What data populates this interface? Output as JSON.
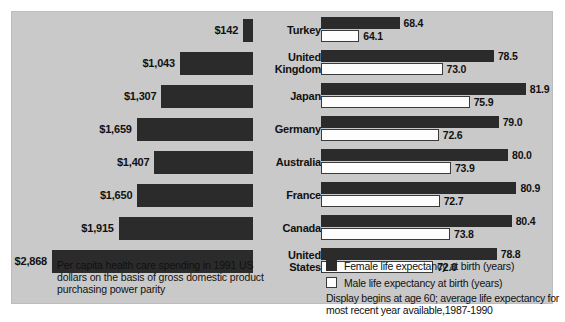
{
  "chart_data": {
    "type": "bar",
    "title": "",
    "orientation": "horizontal",
    "categories": [
      "Turkey",
      "United Kingdom",
      "Japan",
      "Germany",
      "Australia",
      "France",
      "Canada",
      "United States"
    ],
    "panels": [
      {
        "name": "per-capita-health-care-spending",
        "direction": "right-to-left",
        "ylabel": "",
        "xlabel": "Per capita health care spending (1991 US dollars, PPP)",
        "value_prefix": "$",
        "values": [
          142,
          1043,
          1307,
          1659,
          1407,
          1650,
          1915,
          2868
        ],
        "value_labels": [
          "$142",
          "$1,043",
          "$1,307",
          "$1,659",
          "$1,407",
          "$1,650",
          "$1,915",
          "$2,868"
        ],
        "xlim": [
          0,
          2868
        ],
        "color": "#2b2b2b"
      },
      {
        "name": "life-expectancy-at-birth",
        "direction": "left-to-right",
        "xlabel": "Life expectancy at birth (years)",
        "xlim": [
          60,
          83
        ],
        "axis_start": 60,
        "series": [
          {
            "name": "Female life expectancy at birth (years)",
            "color": "#2b2b2b",
            "values": [
              68.4,
              78.5,
              81.9,
              79.0,
              80.0,
              80.9,
              80.4,
              78.8
            ],
            "value_labels": [
              "68.4",
              "78.5",
              "81.9",
              "79.0",
              "80.0",
              "80.9",
              "80.4",
              "78.8"
            ]
          },
          {
            "name": "Male life expectancy at birth (years)",
            "color": "#ffffff",
            "values": [
              64.1,
              73.0,
              75.9,
              72.6,
              73.9,
              72.7,
              73.8,
              72.0
            ],
            "value_labels": [
              "64.1",
              "73.0",
              "75.9",
              "72.6",
              "73.9",
              "72.7",
              "73.8",
              "72.0"
            ]
          }
        ],
        "grid": false,
        "legend_position": "bottom-right"
      }
    ]
  },
  "rows": [
    {
      "country_line1": "Turkey",
      "country_line2": "",
      "spend_label": "$142",
      "spend": 142,
      "female": 68.4,
      "female_label": "68.4",
      "male": 64.1,
      "male_label": "64.1"
    },
    {
      "country_line1": "United",
      "country_line2": "Kingdom",
      "spend_label": "$1,043",
      "spend": 1043,
      "female": 78.5,
      "female_label": "78.5",
      "male": 73.0,
      "male_label": "73.0"
    },
    {
      "country_line1": "Japan",
      "country_line2": "",
      "spend_label": "$1,307",
      "spend": 1307,
      "female": 81.9,
      "female_label": "81.9",
      "male": 75.9,
      "male_label": "75.9"
    },
    {
      "country_line1": "Germany",
      "country_line2": "",
      "spend_label": "$1,659",
      "spend": 1659,
      "female": 79.0,
      "female_label": "79.0",
      "male": 72.6,
      "male_label": "72.6"
    },
    {
      "country_line1": "Australia",
      "country_line2": "",
      "spend_label": "$1,407",
      "spend": 1407,
      "female": 80.0,
      "female_label": "80.0",
      "male": 73.9,
      "male_label": "73.9"
    },
    {
      "country_line1": "France",
      "country_line2": "",
      "spend_label": "$1,650",
      "spend": 1650,
      "female": 80.9,
      "female_label": "80.9",
      "male": 72.7,
      "male_label": "72.7"
    },
    {
      "country_line1": "Canada",
      "country_line2": "",
      "spend_label": "$1,915",
      "spend": 1915,
      "female": 80.4,
      "female_label": "80.4",
      "male": 73.8,
      "male_label": "73.8"
    },
    {
      "country_line1": "United",
      "country_line2": "States",
      "spend_label": "$2,868",
      "spend": 2868,
      "female": 78.8,
      "female_label": "78.8",
      "male": 72.0,
      "male_label": "72.0"
    }
  ],
  "notes": {
    "spending": "Per capita health care spending in 1991 US dollars on the basis of gross domestic product purchasing power parity",
    "display": "Display begins at age 60; average life expectancy for most recent year available,1987-1990"
  },
  "legend": [
    {
      "key": "female",
      "label": "Female life expectancy at birth (years)",
      "color": "#2b2b2b"
    },
    {
      "key": "male",
      "label": "Male life expectancy at birth (years)",
      "color": "#ffffff"
    }
  ],
  "caption": "",
  "colors": {
    "panel_background": "#c9c9c9",
    "bar_dark": "#2b2b2b",
    "bar_light": "#fdfdfd",
    "text": "#111111"
  }
}
